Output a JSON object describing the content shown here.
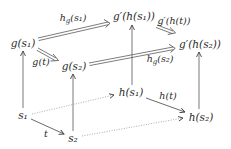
{
  "diagram": {
    "type": "commutative-cube",
    "colors": {
      "ink": "#2a2a2a",
      "line": "#444444",
      "dotted": "#888888",
      "background": "#ffffff"
    },
    "nodes": {
      "g_s1": {
        "label": "g(s₁)",
        "x": 23,
        "y": 43
      },
      "g_s2": {
        "label": "g(s₂)",
        "x": 74,
        "y": 66
      },
      "gp_h_s1": {
        "label": "g′(h(s₁))",
        "x": 134,
        "y": 16
      },
      "gp_h_s2": {
        "label": "g′(h(s₂))",
        "x": 200,
        "y": 44
      },
      "s1": {
        "label": "s₁",
        "x": 23,
        "y": 115
      },
      "s2": {
        "label": "s₂",
        "x": 73,
        "y": 138
      },
      "h_s1": {
        "label": "h(s₁)",
        "x": 131,
        "y": 92
      },
      "h_s2": {
        "label": "h(s₂)",
        "x": 201,
        "y": 117
      }
    },
    "edges": {
      "hg_s1": {
        "label": "h_g(s₁)",
        "from": "g_s1",
        "to": "gp_h_s1",
        "style": "double",
        "lx": 73,
        "ly": 19
      },
      "g_t": {
        "label": "g(t)",
        "from": "g_s1",
        "to": "g_s2",
        "style": "double",
        "lx": 41,
        "ly": 62
      },
      "hg_s2": {
        "label": "h_g(s₂)",
        "from": "g_s2",
        "to": "gp_h_s2",
        "style": "double",
        "lx": 160,
        "ly": 60
      },
      "gp_h_t": {
        "label": "g′(h(t))",
        "from": "gp_h_s1",
        "to": "gp_h_s2",
        "style": "double",
        "lx": 174,
        "ly": 21
      },
      "h_t": {
        "label": "h(t)",
        "from": "h_s1",
        "to": "h_s2",
        "style": "solid",
        "lx": 168,
        "ly": 96
      },
      "t": {
        "label": "t",
        "from": "s1",
        "to": "s2",
        "style": "solid",
        "lx": 46,
        "ly": 134
      },
      "s1_h_s1": {
        "label": "",
        "from": "s1",
        "to": "h_s1",
        "style": "dotted"
      },
      "s2_h_s2": {
        "label": "",
        "from": "s2",
        "to": "h_s2",
        "style": "dotted"
      },
      "s1_g_s1": {
        "label": "",
        "from": "s1",
        "to": "g_s1",
        "style": "solid"
      },
      "s2_g_s2": {
        "label": "",
        "from": "s2",
        "to": "g_s2",
        "style": "solid"
      },
      "h_s1_gp": {
        "label": "",
        "from": "h_s1",
        "to": "gp_h_s1",
        "style": "solid"
      },
      "h_s2_gp": {
        "label": "",
        "from": "h_s2",
        "to": "gp_h_s2",
        "style": "solid"
      }
    }
  }
}
